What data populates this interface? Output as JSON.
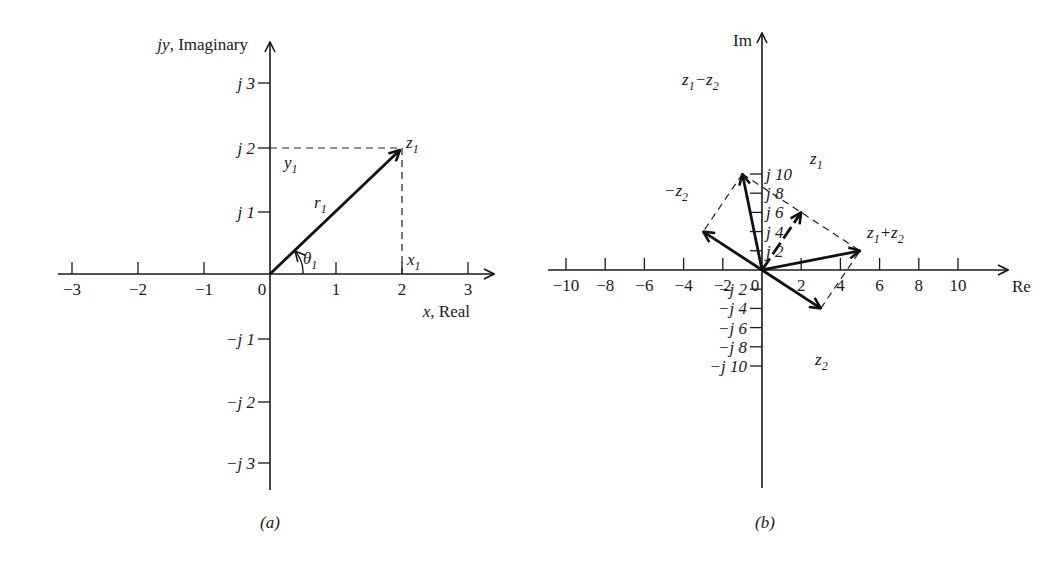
{
  "figure_a": {
    "caption": "(a)",
    "y_axis_label": "jy, Imaginary",
    "x_axis_label": "x, Real",
    "x_ticks": [
      "−3",
      "−2",
      "−1",
      "0",
      "1",
      "2",
      "3"
    ],
    "y_ticks_pos": [
      "j 1",
      "j 2",
      "j 3"
    ],
    "y_ticks_neg": [
      "−j 1",
      "−j 2",
      "−j 3"
    ],
    "vector": {
      "name": "z",
      "sub": "1",
      "re": 2,
      "im": 2
    },
    "labels": {
      "magnitude": {
        "name": "r",
        "sub": "1"
      },
      "angle": {
        "name": "θ",
        "sub": "1"
      },
      "x_component": {
        "name": "x",
        "sub": "1"
      },
      "y_component": {
        "name": "y",
        "sub": "1"
      }
    }
  },
  "figure_b": {
    "caption": "(b)",
    "y_axis_label": "Im",
    "x_axis_label": "Re",
    "x_ticks": [
      "−10",
      "−8",
      "−6",
      "−4",
      "−2",
      "0",
      "2",
      "4",
      "6",
      "8",
      "10"
    ],
    "y_ticks_pos": [
      "j 2",
      "j 4",
      "j 6",
      "j 8",
      "j 10"
    ],
    "y_ticks_neg": [
      "−j 2",
      "−j 4",
      "−j 6",
      "−j 8",
      "−j 10"
    ],
    "vectors": [
      {
        "label": "z1",
        "re": 2,
        "im": 6
      },
      {
        "label": "z2",
        "re": 3,
        "im": -4
      },
      {
        "label": "−z2",
        "re": -3,
        "im": 4
      },
      {
        "label": "z1+z2",
        "re": 5,
        "im": 2
      },
      {
        "label": "z1−z2",
        "re": -1,
        "im": 10
      }
    ]
  },
  "chart_data": [
    {
      "type": "scatter",
      "title": "(a) Complex number z1 in the complex plane",
      "xlabel": "x, Real",
      "ylabel": "jy, Imaginary",
      "xlim": [
        -3,
        3
      ],
      "ylim": [
        -3,
        3
      ],
      "points": [
        {
          "name": "z1",
          "x": 2,
          "y": 2
        }
      ]
    },
    {
      "type": "scatter",
      "title": "(b) Addition and subtraction of complex numbers",
      "xlabel": "Re",
      "ylabel": "Im",
      "xlim": [
        -10,
        10
      ],
      "ylim": [
        -10,
        10
      ],
      "points": [
        {
          "name": "z1",
          "x": 2,
          "y": 6
        },
        {
          "name": "z2",
          "x": 3,
          "y": -4
        },
        {
          "name": "-z2",
          "x": -3,
          "y": 4
        },
        {
          "name": "z1+z2",
          "x": 5,
          "y": 2
        },
        {
          "name": "z1-z2",
          "x": -1,
          "y": 10
        }
      ]
    }
  ]
}
